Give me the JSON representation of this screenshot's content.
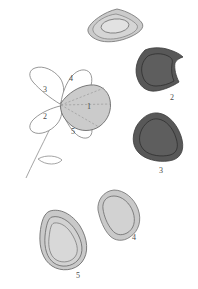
{
  "figure": {
    "background_color": "#ffffff"
  },
  "palette": {
    "dark_fill": "#595959",
    "dark_stroke": "#3a3a3a",
    "light_fill": "#c9c9c9",
    "light_fill_alt": "#cccccc",
    "outline": "#6b6b6b",
    "thin_outline": "#8a8a8a",
    "dashed_line": "#9a9a9a",
    "label_color": "#4a4a4a",
    "paper": "#ffffff"
  },
  "flower": {
    "name": "flower-diagram",
    "petals": [
      {
        "id": "petal-1",
        "label": "1",
        "fill": "light",
        "shaded": true,
        "position": "center-right"
      },
      {
        "id": "petal-2",
        "label": "2",
        "fill": "none",
        "shaded": false,
        "position": "lower-left"
      },
      {
        "id": "petal-3",
        "label": "3",
        "fill": "none",
        "shaded": false,
        "position": "upper-left"
      },
      {
        "id": "petal-4",
        "label": "4",
        "fill": "none",
        "shaded": false,
        "position": "top"
      },
      {
        "id": "petal-5",
        "label": "5",
        "fill": "none",
        "shaded": false,
        "position": "bottom"
      }
    ],
    "stem": {
      "name": "stem",
      "has_leaf": true
    },
    "leaf": {
      "name": "leaf"
    },
    "construction_lines": {
      "name": "dashed-construction-lines",
      "style": "dashed",
      "count": 3
    }
  },
  "specimens": [
    {
      "id": "specimen-1",
      "label": "",
      "fill": "light",
      "shape": "flattened-rhomboid-lens",
      "has_inner_ring": true,
      "position": "top-center"
    },
    {
      "id": "specimen-2",
      "label": "2",
      "fill": "dark",
      "shape": "angular-triangular",
      "has_inner_ring": true,
      "position": "upper-right"
    },
    {
      "id": "specimen-3",
      "label": "3",
      "fill": "dark",
      "shape": "rounded-triangle",
      "has_inner_ring": true,
      "position": "mid-right"
    },
    {
      "id": "specimen-4",
      "label": "4",
      "fill": "light",
      "shape": "teardrop",
      "has_inner_ring": true,
      "position": "lower-center"
    },
    {
      "id": "specimen-5",
      "label": "5",
      "fill": "light",
      "shape": "rounded-triangle-wide",
      "has_inner_ring": true,
      "position": "lower-left"
    }
  ],
  "labels": {
    "flower_petal_1": "1",
    "flower_petal_2": "2",
    "flower_petal_3": "3",
    "flower_petal_4": "4",
    "flower_petal_5": "5",
    "specimen_2": "2",
    "specimen_3": "3",
    "specimen_4": "4",
    "specimen_5": "5"
  }
}
